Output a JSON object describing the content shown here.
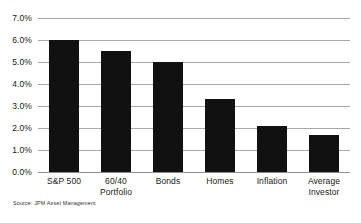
{
  "chart_data": {
    "type": "bar",
    "title": "",
    "subtitle": "",
    "xlabel": "",
    "ylabel": "",
    "categories": [
      "S&P 500",
      "60/40 Portfolio",
      "Bonds",
      "Homes",
      "Inflation",
      "Average Investor"
    ],
    "category_lines": [
      [
        "S&P 500"
      ],
      [
        "60/40",
        "Portfolio"
      ],
      [
        "Bonds"
      ],
      [
        "Homes"
      ],
      [
        "Inflation"
      ],
      [
        "Average",
        "Investor"
      ]
    ],
    "values": [
      6.0,
      5.5,
      5.0,
      3.3,
      2.1,
      1.7
    ],
    "ylim": [
      0.0,
      7.0
    ],
    "ytick_values": [
      0.0,
      1.0,
      2.0,
      3.0,
      4.0,
      5.0,
      6.0,
      7.0
    ],
    "ytick_labels": [
      "0.0%",
      "1.0%",
      "2.0%",
      "3.0%",
      "4.0%",
      "5.0%",
      "6.0%",
      "7.0%"
    ],
    "grid": true,
    "legend": false,
    "legend_position": "none",
    "bar_color": "#111111",
    "gridline_color": "#a8a8a8",
    "text_color": "#1a1a1a"
  },
  "source": {
    "note": "Source: JPM Asset Management"
  }
}
